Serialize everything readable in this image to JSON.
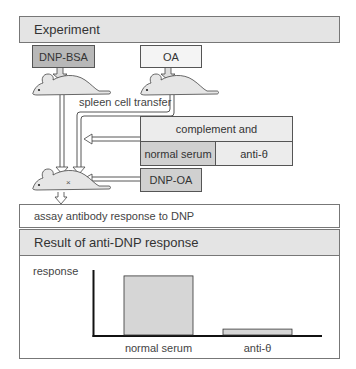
{
  "experiment": {
    "title": "Experiment",
    "immunizations": [
      {
        "label": "DNP-BSA",
        "shade": "dark"
      },
      {
        "label": "OA",
        "shade": "light"
      }
    ],
    "transfer_label": "spleen cell transfer",
    "treatment": {
      "header": "complement and",
      "options": [
        "normal serum",
        "anti-θ"
      ]
    },
    "challenge": "DNP-OA",
    "assay": "assay antibody response to DNP"
  },
  "result": {
    "title": "Result of anti-DNP response"
  },
  "chart_data": {
    "type": "bar",
    "title": "Result of anti-DNP response",
    "ylabel": "response",
    "xlabel": "",
    "categories": [
      "normal serum",
      "anti-θ"
    ],
    "values": [
      100,
      10
    ],
    "ylim": [
      0,
      110
    ],
    "grid": false,
    "units": "relative"
  },
  "colors": {
    "header_bg": "#e4e4e4",
    "dark_box": "#b8b8b8",
    "mid_box": "#d0d0d0",
    "light_box": "#f4f4f4",
    "bar_fill": "#d6d6d6",
    "axis": "#111111"
  }
}
